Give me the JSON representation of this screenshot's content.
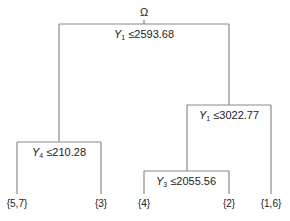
{
  "diagram": {
    "type": "decision-tree",
    "root": {
      "label": "Ω"
    },
    "splits": [
      {
        "id": "s1",
        "var": "Y",
        "sub": "1",
        "op": "≤",
        "value": "2593.68"
      },
      {
        "id": "s2",
        "var": "Y",
        "sub": "4",
        "op": "≤",
        "value": "210.28"
      },
      {
        "id": "s3",
        "var": "Y",
        "sub": "1",
        "op": "≤",
        "value": "3022.77"
      },
      {
        "id": "s4",
        "var": "Y",
        "sub": "3",
        "op": "≤",
        "value": "2055.56"
      }
    ],
    "leaves": [
      {
        "label": "{5,7}"
      },
      {
        "label": "{3}"
      },
      {
        "label": "{4}"
      },
      {
        "label": "{2}"
      },
      {
        "label": "{1,6}"
      }
    ],
    "line_color": "#888888"
  }
}
